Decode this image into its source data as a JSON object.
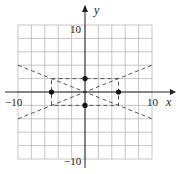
{
  "chart_data": {
    "type": "line",
    "title": "",
    "xlabel": "x",
    "ylabel": "y",
    "xlim": [
      -10,
      10
    ],
    "ylim": [
      -10,
      10
    ],
    "grid": true,
    "grid_step": 2,
    "x_tick_labels": [
      {
        "value": -10,
        "label": "−10"
      },
      {
        "value": 10,
        "label": "10"
      }
    ],
    "y_tick_labels": [
      {
        "value": 10,
        "label": "10"
      },
      {
        "value": -10,
        "label": "−10"
      }
    ],
    "series": [
      {
        "name": "line y = 0.4x",
        "style": "dashed",
        "points": [
          [
            -10,
            -4
          ],
          [
            10,
            4
          ]
        ]
      },
      {
        "name": "line y = -0.4x",
        "style": "dashed",
        "points": [
          [
            -10,
            4
          ],
          [
            10,
            -4
          ]
        ]
      },
      {
        "name": "rectangle",
        "style": "dashed",
        "points": [
          [
            -5,
            2
          ],
          [
            5,
            2
          ],
          [
            5,
            -2
          ],
          [
            -5,
            -2
          ],
          [
            -5,
            2
          ]
        ]
      }
    ],
    "points": [
      {
        "x": -5,
        "y": 0
      },
      {
        "x": 5,
        "y": 0
      },
      {
        "x": 0,
        "y": 2
      },
      {
        "x": 0,
        "y": -2
      }
    ],
    "legend": null
  },
  "labels": {
    "x_axis": "x",
    "y_axis": "y",
    "x_min": "−10",
    "x_max": "10",
    "y_max": "10",
    "y_min": "−10"
  },
  "colors": {
    "grid": "#b8b8b8",
    "axis": "#222222",
    "dashed": "#555555",
    "point": "#111111"
  }
}
